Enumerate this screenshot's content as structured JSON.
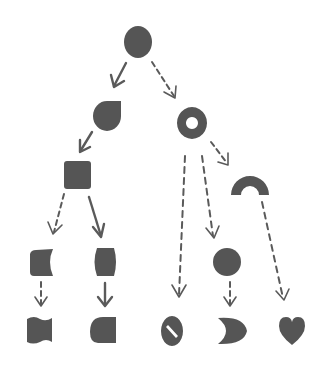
{
  "diagram": {
    "type": "shape-transformation-tree",
    "colors": {
      "shape": "#555555",
      "arrow": "#5a5a5a",
      "background": "#ffffff"
    },
    "nodes": [
      {
        "id": "n1",
        "shape": "circle",
        "x": 138,
        "y": 42
      },
      {
        "id": "n2",
        "shape": "teardrop",
        "x": 108,
        "y": 115
      },
      {
        "id": "n3",
        "shape": "ring",
        "x": 192,
        "y": 123
      },
      {
        "id": "n4",
        "shape": "rounded-square",
        "x": 78,
        "y": 175
      },
      {
        "id": "n5",
        "shape": "half-ring-arch",
        "x": 250,
        "y": 182
      },
      {
        "id": "n6",
        "shape": "concave-right-square",
        "x": 42,
        "y": 262
      },
      {
        "id": "n7",
        "shape": "barrel",
        "x": 105,
        "y": 262
      },
      {
        "id": "n8",
        "shape": "pie-missing-quarter",
        "x": 230,
        "y": 262
      },
      {
        "id": "n9",
        "shape": "wavy-square",
        "x": 40,
        "y": 330
      },
      {
        "id": "n10",
        "shape": "d-shape-flat-right",
        "x": 103,
        "y": 330
      },
      {
        "id": "n11",
        "shape": "slashed-ellipse",
        "x": 172,
        "y": 330
      },
      {
        "id": "n12",
        "shape": "crescent",
        "x": 233,
        "y": 330
      },
      {
        "id": "n13",
        "shape": "heart",
        "x": 292,
        "y": 330
      }
    ],
    "edges": [
      {
        "from": "n1",
        "to": "n2",
        "style": "solid"
      },
      {
        "from": "n1",
        "to": "n3",
        "style": "dashed"
      },
      {
        "from": "n2",
        "to": "n4",
        "style": "solid"
      },
      {
        "from": "n3",
        "to": "n5",
        "style": "dashed"
      },
      {
        "from": "n3",
        "to": "n11",
        "style": "dashed"
      },
      {
        "from": "n3",
        "to": "n8",
        "style": "dashed"
      },
      {
        "from": "n4",
        "to": "n6",
        "style": "dashed"
      },
      {
        "from": "n4",
        "to": "n7",
        "style": "solid"
      },
      {
        "from": "n5",
        "to": "n13",
        "style": "dashed"
      },
      {
        "from": "n6",
        "to": "n9",
        "style": "dashed"
      },
      {
        "from": "n7",
        "to": "n10",
        "style": "solid"
      },
      {
        "from": "n8",
        "to": "n12",
        "style": "dashed"
      }
    ],
    "legend": {
      "solid": "solid arrow",
      "dashed": "dashed arrow"
    }
  }
}
